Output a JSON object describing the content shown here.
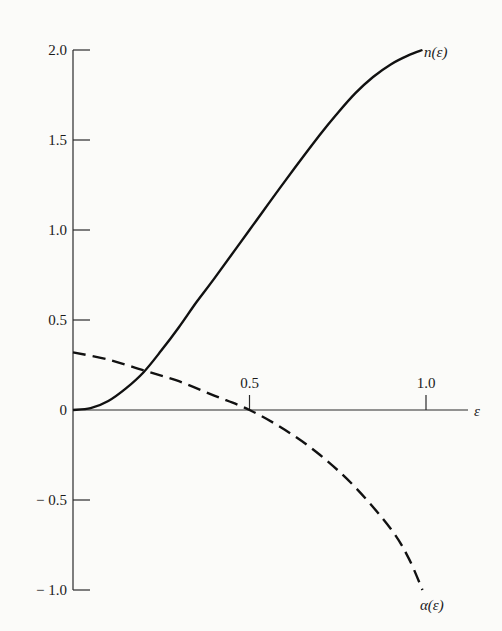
{
  "chart_data": {
    "type": "line",
    "title": "",
    "xlabel": "ε",
    "ylabel": "",
    "xlim": [
      0,
      1.1
    ],
    "ylim": [
      -1.0,
      2.0
    ],
    "grid": false,
    "legend": "inline labels at curve ends",
    "x_ticks": [
      {
        "value": 0.5,
        "label": "0.5"
      },
      {
        "value": 1.0,
        "label": "1.0"
      }
    ],
    "y_ticks": [
      {
        "value": 2.0,
        "label": "2.0"
      },
      {
        "value": 1.5,
        "label": "1.5"
      },
      {
        "value": 1.0,
        "label": "1.0"
      },
      {
        "value": 0.5,
        "label": "0.5"
      },
      {
        "value": 0,
        "label": "0"
      },
      {
        "value": -0.5,
        "label": "− 0.5"
      },
      {
        "value": -1.0,
        "label": "− 1.0"
      }
    ],
    "series": [
      {
        "name": "n(ε)",
        "style": "solid",
        "x": [
          0,
          0.05,
          0.1,
          0.15,
          0.2,
          0.25,
          0.3,
          0.35,
          0.4,
          0.5,
          0.6,
          0.7,
          0.75,
          0.8,
          0.85,
          0.9,
          0.95,
          0.99
        ],
        "y": [
          0,
          0.01,
          0.05,
          0.12,
          0.21,
          0.33,
          0.46,
          0.6,
          0.73,
          1.0,
          1.27,
          1.53,
          1.65,
          1.76,
          1.85,
          1.92,
          1.97,
          2.0
        ]
      },
      {
        "name": "α(ε)",
        "style": "dashed",
        "x": [
          0,
          0.1,
          0.2,
          0.3,
          0.4,
          0.5,
          0.6,
          0.7,
          0.8,
          0.9,
          0.95,
          0.99
        ],
        "y": [
          0.32,
          0.28,
          0.22,
          0.16,
          0.08,
          0.0,
          -0.11,
          -0.25,
          -0.43,
          -0.66,
          -0.82,
          -1.0
        ]
      }
    ],
    "annotations": [
      {
        "text": "n(ε)",
        "at": [
          1.0,
          2.0
        ]
      },
      {
        "text": "α(ε)",
        "at": [
          1.0,
          -1.05
        ]
      }
    ]
  },
  "labels": {
    "x_axis": "ε",
    "series_n": "n(ε)",
    "series_alpha": "α(ε)"
  }
}
